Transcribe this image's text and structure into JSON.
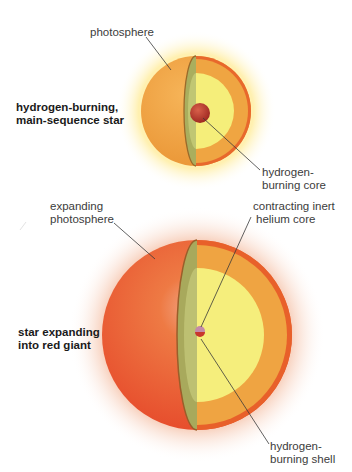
{
  "diagram": {
    "colors": {
      "main_star_surface": "#f0a640",
      "giant_surface": "#ec5a28",
      "cut_face_shell": "#efa240",
      "cut_face_rim": "#e8662a",
      "inner_zone": "#f5ef78",
      "cut_side_green": "#a6ae5c",
      "core_red": "#b8322a",
      "helium_core": "#c48aa8",
      "glow_small": "#fff2b8",
      "glow_large": "#f6c2a8",
      "leader_line": "#3a3a3a"
    },
    "stages": [
      {
        "id": "main-sequence",
        "title_lines": [
          "hydrogen-burning,",
          "main-sequence star"
        ],
        "labels": {
          "photosphere": "photosphere",
          "core_lines": [
            "hydrogen-",
            "burning core"
          ]
        }
      },
      {
        "id": "red-giant",
        "title_lines": [
          "star expanding",
          "into red giant"
        ],
        "labels": {
          "photosphere_lines": [
            "expanding",
            "photosphere"
          ],
          "helium_core_lines": [
            "contracting inert",
            "helium core"
          ],
          "shell_lines": [
            "hydrogen-",
            "burning shell"
          ]
        }
      }
    ]
  }
}
